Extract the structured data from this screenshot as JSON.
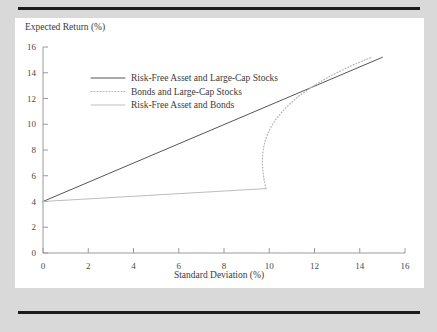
{
  "figure": {
    "background_color": "#d9d9d9",
    "panel_color": "#ffffff",
    "rule_color": "#1c1c1c"
  },
  "chart_data": {
    "type": "line",
    "title": "",
    "xlabel": "Standard Deviation (%)",
    "ylabel": "Expected Return (%)",
    "xlim": [
      0,
      16
    ],
    "ylim": [
      0,
      16
    ],
    "xticks": [
      0,
      2,
      4,
      6,
      8,
      10,
      12,
      14,
      16
    ],
    "yticks": [
      0,
      2,
      4,
      6,
      8,
      10,
      12,
      14,
      16
    ],
    "xtick_labels": [
      "0",
      "2",
      "4",
      "6",
      "8",
      "10",
      "12",
      "14",
      "16"
    ],
    "ytick_labels": [
      "0",
      "2",
      "4",
      "6",
      "8",
      "10",
      "12",
      "14",
      "16"
    ],
    "grid": false,
    "legend_position": "upper left",
    "series": [
      {
        "name": "Risk-Free Asset and Large-Cap Stocks",
        "style": "solid",
        "color": "#555555",
        "width": 1.0,
        "points": [
          [
            0,
            4.0
          ],
          [
            15,
            15.2
          ]
        ]
      },
      {
        "name": "Bonds and Large-Cap Stocks",
        "style": "dotted",
        "color": "#b4b4b4",
        "width": 1.2,
        "points": [
          [
            9.85,
            5.0
          ],
          [
            9.78,
            5.6
          ],
          [
            9.73,
            6.2
          ],
          [
            9.7,
            6.8
          ],
          [
            9.7,
            7.4
          ],
          [
            9.73,
            8.0
          ],
          [
            9.8,
            8.6
          ],
          [
            9.92,
            9.2
          ],
          [
            10.08,
            9.8
          ],
          [
            10.3,
            10.4
          ],
          [
            10.58,
            11.0
          ],
          [
            10.92,
            11.6
          ],
          [
            11.32,
            12.2
          ],
          [
            11.8,
            12.8
          ],
          [
            12.35,
            13.4
          ],
          [
            12.98,
            14.0
          ],
          [
            13.7,
            14.6
          ],
          [
            14.52,
            15.2
          ]
        ]
      },
      {
        "name": "Risk-Free Asset and Bonds",
        "style": "solid",
        "color": "#bdbdbd",
        "width": 1.0,
        "points": [
          [
            0,
            4.0
          ],
          [
            9.85,
            5.0
          ]
        ]
      }
    ],
    "annotations": []
  },
  "legend": {
    "entries": [
      {
        "label": "Risk-Free Asset and Large-Cap Stocks",
        "swatch": "solid-dark"
      },
      {
        "label": "Bonds and Large-Cap Stocks",
        "swatch": "dotted-light"
      },
      {
        "label": "Risk-Free Asset and Bonds",
        "swatch": "solid-light"
      }
    ]
  }
}
